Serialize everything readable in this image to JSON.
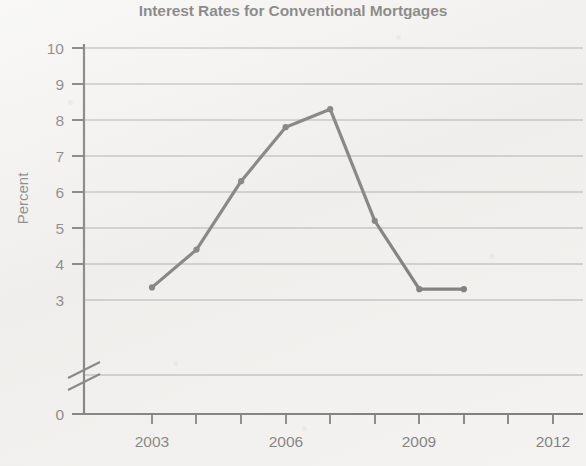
{
  "chart_data": {
    "type": "line",
    "title": "Interest Rates for Conventional Mortgages",
    "xlabel": "",
    "ylabel": "Percent",
    "x": [
      2003,
      2004,
      2005,
      2006,
      2007,
      2008,
      2009,
      2010
    ],
    "values": [
      3.35,
      4.4,
      6.3,
      7.8,
      8.3,
      5.2,
      3.3,
      3.3
    ],
    "series": [
      {
        "name": "Interest rate",
        "values": [
          3.35,
          4.4,
          6.3,
          7.8,
          8.3,
          5.2,
          3.3,
          3.3
        ]
      }
    ],
    "xlim": [
      2002,
      2013
    ],
    "ylim": [
      3,
      10
    ],
    "y_axis_break": true,
    "y_axis_break_note": "axis broken between 0 and 3",
    "yticks": [
      0,
      3,
      4,
      5,
      6,
      7,
      8,
      9,
      10
    ],
    "ytick_labels": [
      "0",
      "3",
      "4",
      "5",
      "6",
      "7",
      "8",
      "9",
      "10"
    ],
    "xticks": [
      2003,
      2004,
      2005,
      2006,
      2007,
      2008,
      2009,
      2010,
      2011,
      2012
    ],
    "xtick_labels": [
      "2003",
      "",
      "",
      "2006",
      "",
      "",
      "2009",
      "",
      "",
      "2012"
    ],
    "xtick_labels_shown": [
      "2003",
      "2006",
      "2009",
      "2012"
    ],
    "grid": true,
    "grid_axis": "y",
    "legend": false,
    "legend_position": "none",
    "line_color": "#111111",
    "grid_color": "#6e6e6e",
    "axis_color": "#1a1a1a",
    "background_color": "#f2f1ef",
    "marker": "circle",
    "annotations": []
  },
  "axis": {
    "y_title": "Percent",
    "y_labels": [
      "10",
      "9",
      "8",
      "7",
      "6",
      "5",
      "4",
      "3",
      "0"
    ],
    "x_labels": [
      "2003",
      "2006",
      "2009",
      "2012"
    ]
  }
}
